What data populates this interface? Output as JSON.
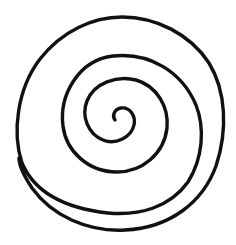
{
  "image": {
    "subject": "spiral",
    "description": "Black line-drawn spiral on a white background with about three and a half turns, coiling inward to a small curled tip near the center",
    "colors": {
      "background": "#ffffff",
      "stroke": "#111111"
    },
    "stroke_width": 3.4
  }
}
